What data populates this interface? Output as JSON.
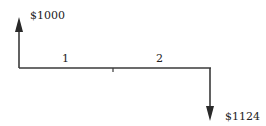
{
  "diagram": {
    "type": "cash-flow",
    "inflow": {
      "label": "$1000",
      "period": 0,
      "direction": "up"
    },
    "outflow": {
      "label": "$1124",
      "period": 2,
      "direction": "down"
    },
    "periods": [
      {
        "label": "1"
      },
      {
        "label": "2"
      }
    ],
    "colors": {
      "line": "#3a3a3a",
      "text": "#222222"
    }
  }
}
